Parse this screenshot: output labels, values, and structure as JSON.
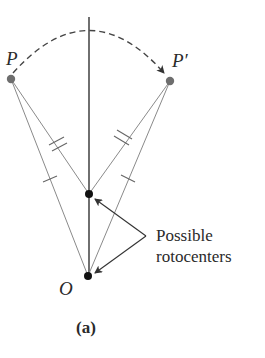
{
  "diagram": {
    "points": {
      "P": {
        "label": "P",
        "x": 11,
        "y": 79,
        "color": "#6e6e6e"
      },
      "P_prime": {
        "label": "P′",
        "x": 170,
        "y": 81,
        "color": "#6e6e6e"
      },
      "mid": {
        "x": 89,
        "y": 194,
        "color": "#111111"
      },
      "O": {
        "label": "O",
        "x": 88,
        "y": 276,
        "color": "#111111"
      }
    },
    "annotation": {
      "line1": "Possible",
      "line2": "rotocenters"
    },
    "caption": "(a)",
    "colors": {
      "axis": "#333333",
      "thin_lines": "#8a8a8a",
      "arc": "#444444",
      "text": "#2a2a2a"
    }
  }
}
